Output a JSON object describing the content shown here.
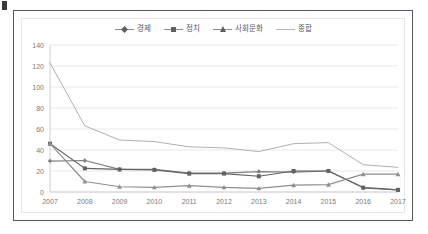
{
  "chart_data": {
    "type": "line",
    "title": "",
    "subtitle": "",
    "xlabel": "",
    "ylabel": "",
    "categories": [
      "2007",
      "2008",
      "2009",
      "2010",
      "2011",
      "2012",
      "2013",
      "2014",
      "2015",
      "2016",
      "2017"
    ],
    "ylim": [
      0,
      140
    ],
    "yticks": [
      0,
      20,
      40,
      60,
      80,
      100,
      120,
      140
    ],
    "grid": true,
    "legend_position": "top-center",
    "series": [
      {
        "name": "경제",
        "marker": "diamond",
        "color": "#808080",
        "values": [
          29.5,
          30.0,
          21.5,
          21.5,
          18.0,
          18.0,
          19.5,
          19.0,
          20.0,
          4.5,
          2.0
        ]
      },
      {
        "name": "정치",
        "marker": "square",
        "color": "#636363",
        "values": [
          46.0,
          22.5,
          21.5,
          21.0,
          17.5,
          17.5,
          15.0,
          20.0,
          20.0,
          4.0,
          2.0
        ]
      },
      {
        "name": "사회문화",
        "marker": "triangle",
        "color": "#8f8f8f",
        "values": [
          46.0,
          10.0,
          5.0,
          4.5,
          6.0,
          4.5,
          3.5,
          6.5,
          7.0,
          17.0,
          17.0
        ]
      },
      {
        "name": "종합",
        "marker": "none",
        "color": "#b0b0b0",
        "values": [
          123.0,
          63.0,
          49.5,
          48.0,
          43.0,
          42.0,
          38.5,
          46.0,
          47.0,
          26.0,
          23.5
        ]
      }
    ]
  },
  "legend": {
    "items": [
      {
        "label": "경제",
        "key": "diamond"
      },
      {
        "label": "정치",
        "key": "square"
      },
      {
        "label": "사회문화",
        "key": "tri"
      },
      {
        "label": "종합",
        "key": "plain"
      }
    ]
  },
  "axes": {
    "y_labels": [
      "140",
      "120",
      "100",
      "80",
      "60",
      "40",
      "20",
      "0"
    ],
    "x_labels": [
      "2007",
      "2008",
      "2009",
      "2010",
      "2011",
      "2012",
      "2013",
      "2014",
      "2015",
      "2016",
      "2017"
    ]
  },
  "colors": {
    "frame": "#555b60",
    "inner_frame": "#e6e6e6",
    "grid": "#e8e8e8",
    "axis_text": "#7a7a7a",
    "legend_text": "#595959",
    "background": "#ffffff"
  }
}
